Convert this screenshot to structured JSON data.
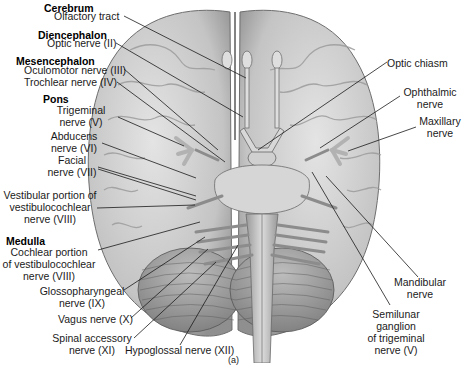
{
  "figure": {
    "panel_label": "(a)",
    "groups": [
      {
        "name": "Cerebrum"
      },
      {
        "name": "Diencephalon"
      },
      {
        "name": "Mesencephalon"
      },
      {
        "name": "Pons"
      },
      {
        "name": "Medulla"
      }
    ],
    "left_labels": [
      {
        "lines": [
          "Olfactory tract"
        ]
      },
      {
        "lines": [
          "Optic nerve (II)"
        ]
      },
      {
        "lines": [
          "Oculomotor nerve (III)"
        ]
      },
      {
        "lines": [
          "Trochlear nerve (IV)"
        ]
      },
      {
        "lines": [
          "Trigeminal",
          "nerve (V)"
        ]
      },
      {
        "lines": [
          "Abducens",
          "nerve (VI)"
        ]
      },
      {
        "lines": [
          "Facial",
          "nerve (VII)"
        ]
      },
      {
        "lines": [
          "Vestibular portion of",
          "vestibulocochlear",
          "nerve (VIII)"
        ]
      },
      {
        "lines": [
          "Cochlear portion",
          "of vestibulocochlear",
          "nerve (VIII)"
        ]
      },
      {
        "lines": [
          "Glossopharyngeal",
          "nerve (IX)"
        ]
      },
      {
        "lines": [
          "Vagus nerve (X)"
        ]
      },
      {
        "lines": [
          "Spinal accessory",
          "nerve (XI)"
        ]
      },
      {
        "lines": [
          "Hypoglossal nerve (XII)"
        ]
      }
    ],
    "right_labels": [
      {
        "lines": [
          "Optic chiasm"
        ]
      },
      {
        "lines": [
          "Ophthalmic",
          "nerve"
        ]
      },
      {
        "lines": [
          "Maxillary",
          "nerve"
        ]
      },
      {
        "lines": [
          "Mandibular",
          "nerve"
        ]
      },
      {
        "lines": [
          "Semilunar",
          "ganglion",
          "of trigeminal",
          "nerve (V)"
        ]
      }
    ]
  },
  "colors": {
    "background": "#ffffff",
    "brain_fill": "#c9c9c9",
    "brain_shadow": "#8a8a8a",
    "leader_line": "#1a1a1a",
    "label_text": "#1a1a1a"
  }
}
